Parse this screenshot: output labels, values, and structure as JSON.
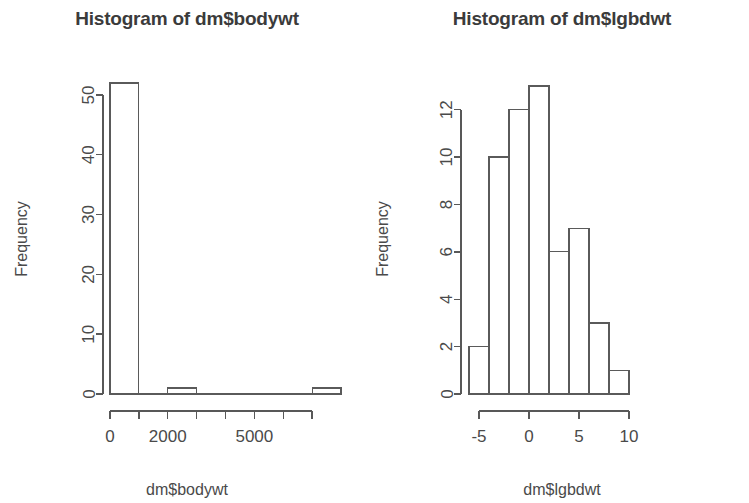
{
  "figure": {
    "background": "#ffffff",
    "foreground": "#4a4a4a",
    "panel_count": 2
  },
  "panels": [
    {
      "id": "bodywt",
      "title": "Histogram of dm$bodywt",
      "xlabel": "dm$bodywt",
      "ylabel": "Frequency"
    },
    {
      "id": "lgbdwt",
      "title": "Histogram of dm$lgbdwt",
      "xlabel": "dm$lgbdwt",
      "ylabel": "Frequency"
    }
  ],
  "chart_data": [
    {
      "type": "bar",
      "id": "histogram-bodywt",
      "title": "Histogram of dm$bodywt",
      "xlabel": "dm$bodywt",
      "ylabel": "Frequency",
      "bin_edges": [
        0,
        1000,
        2000,
        3000,
        4000,
        5000,
        6000,
        7000,
        8000
      ],
      "categories": [
        "0-1000",
        "1000-2000",
        "2000-3000",
        "3000-4000",
        "4000-5000",
        "5000-6000",
        "6000-7000",
        "7000-8000"
      ],
      "values": [
        52,
        0,
        1,
        0,
        0,
        0,
        0,
        1
      ],
      "xlim": [
        0,
        8000
      ],
      "ylim": [
        0,
        52
      ],
      "xticks": [
        0,
        1000,
        2000,
        3000,
        4000,
        5000,
        6000,
        7000
      ],
      "xtick_labels": [
        "0",
        "",
        "2000",
        "",
        "",
        "5000",
        "",
        ""
      ],
      "yticks": [
        0,
        10,
        20,
        30,
        40,
        50
      ],
      "ytick_labels": [
        "0",
        "10",
        "20",
        "30",
        "40",
        "50"
      ],
      "grid": false,
      "legend": false,
      "bar_fill": "#ffffff",
      "bar_stroke": "#5a5a5a"
    },
    {
      "type": "bar",
      "id": "histogram-lgbdwt",
      "title": "Histogram of dm$lgbdwt",
      "xlabel": "dm$lgbdwt",
      "ylabel": "Frequency",
      "bin_edges": [
        -6,
        -4,
        -2,
        0,
        2,
        4,
        6,
        8,
        10
      ],
      "categories": [
        "-6 to -4",
        "-4 to -2",
        "-2 to 0",
        "0 to 2",
        "2 to 4",
        "4 to 6",
        "6 to 8",
        "8 to 10"
      ],
      "values": [
        2,
        10,
        12,
        13,
        6,
        7,
        3,
        1
      ],
      "xlim": [
        -6,
        10
      ],
      "ylim": [
        0,
        13
      ],
      "xticks": [
        -5,
        0,
        5,
        10
      ],
      "xtick_labels": [
        "-5",
        "0",
        "5",
        "10"
      ],
      "yticks": [
        0,
        2,
        4,
        6,
        8,
        10,
        12
      ],
      "ytick_labels": [
        "0",
        "2",
        "4",
        "6",
        "8",
        "10",
        "12"
      ],
      "grid": false,
      "legend": false,
      "bar_fill": "#ffffff",
      "bar_stroke": "#5a5a5a"
    }
  ]
}
